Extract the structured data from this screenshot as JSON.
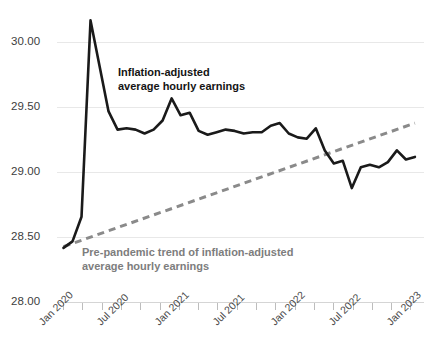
{
  "chart_data": {
    "type": "line",
    "title": "",
    "subtitle": "",
    "xlabel": "",
    "ylabel": "",
    "ylim": [
      28.0,
      30.25
    ],
    "xlim": [
      "Jan 2020",
      "Apr 2023"
    ],
    "grid": true,
    "legend_position": "none",
    "y_ticks": [
      "30.00",
      "29.50",
      "29.00",
      "28.50",
      "28.00"
    ],
    "y_tick_values": [
      30.0,
      29.5,
      29.0,
      28.5,
      28.0
    ],
    "x_ticks": [
      "Jan 2020",
      "Jul 2020",
      "Jan 2021",
      "Jul 2021",
      "Jan 2022",
      "Jul 2022",
      "Jan 2023"
    ],
    "x_tick_values": [
      0,
      6,
      12,
      18,
      24,
      30,
      36
    ],
    "x_minor_tick_interval_months": 3,
    "annotations": [
      {
        "id": "main-series-label",
        "text_line1": "Inflation-adjusted",
        "text_line2": "average hourly earnings",
        "color": "#141414"
      },
      {
        "id": "trend-series-label",
        "text_line1": "Pre-pandemic trend of inflation-adjusted",
        "text_line2": "average hourly earnings",
        "color": "#7d7d7d"
      }
    ],
    "series": [
      {
        "name": "Inflation-adjusted average hourly earnings",
        "style": "solid",
        "color": "#1a1a1a",
        "x": [
          "Jan 2020",
          "Feb 2020",
          "Mar 2020",
          "Apr 2020",
          "May 2020",
          "Jun 2020",
          "Jul 2020",
          "Aug 2020",
          "Sep 2020",
          "Oct 2020",
          "Nov 2020",
          "Dec 2020",
          "Jan 2021",
          "Feb 2021",
          "Mar 2021",
          "Apr 2021",
          "May 2021",
          "Jun 2021",
          "Jul 2021",
          "Aug 2021",
          "Sep 2021",
          "Oct 2021",
          "Nov 2021",
          "Dec 2021",
          "Jan 2022",
          "Feb 2022",
          "Mar 2022",
          "Apr 2022",
          "May 2022",
          "Jun 2022",
          "Jul 2022",
          "Aug 2022",
          "Sep 2022",
          "Oct 2022",
          "Nov 2022",
          "Dec 2022",
          "Jan 2023",
          "Feb 2023",
          "Mar 2023",
          "Apr 2023"
        ],
        "values": [
          28.42,
          28.47,
          28.66,
          30.17,
          29.82,
          29.47,
          29.33,
          29.34,
          29.33,
          29.3,
          29.33,
          29.4,
          29.57,
          29.44,
          29.46,
          29.32,
          29.29,
          29.31,
          29.33,
          29.32,
          29.3,
          29.31,
          29.31,
          29.36,
          29.38,
          29.3,
          29.27,
          29.26,
          29.34,
          29.17,
          29.07,
          29.09,
          28.88,
          29.04,
          29.06,
          29.04,
          29.08,
          29.17,
          29.1,
          29.12
        ]
      },
      {
        "name": "Pre-pandemic trend of inflation-adjusted average hourly earnings",
        "style": "dashed",
        "color": "#8a8a8a",
        "x": [
          "Jan 2020",
          "Apr 2023"
        ],
        "values": [
          28.43,
          29.38
        ]
      }
    ]
  }
}
